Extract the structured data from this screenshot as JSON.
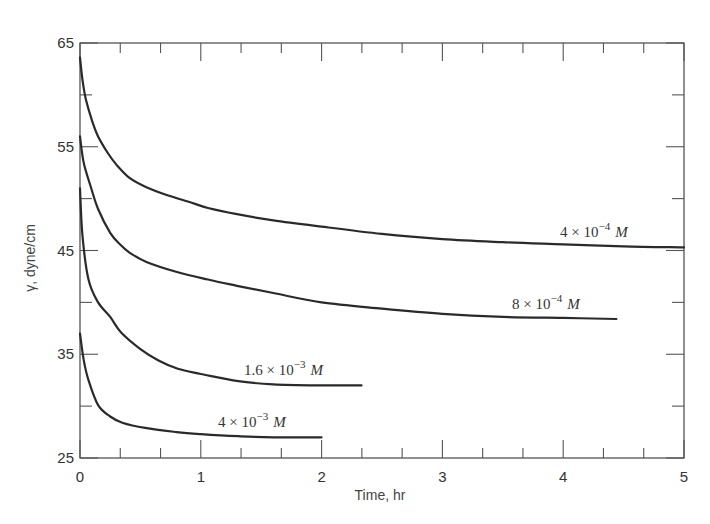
{
  "chart_data": {
    "type": "line",
    "title": "",
    "xlabel": "Time, hr",
    "ylabel": "γ, dyne/cm",
    "xlim": [
      0,
      5
    ],
    "ylim": [
      25,
      65
    ],
    "xticks": [
      0,
      1,
      2,
      3,
      4,
      5
    ],
    "x_minor_step": 0.3333,
    "yticks": [
      25,
      35,
      45,
      55,
      65
    ],
    "y_minor_step": 5,
    "grid": false,
    "legend": "inline curve labels",
    "series": [
      {
        "name": "4 × 10⁻⁴ M",
        "label_base": "4 × 10",
        "label_exp": "−4",
        "label_unit": "M",
        "label_pos": [
          560,
          237
        ],
        "x": [
          0,
          0.02,
          0.05,
          0.1,
          0.15,
          0.23,
          0.3,
          0.41,
          0.55,
          0.73,
          0.9,
          1.06,
          1.3,
          1.6,
          2.0,
          2.5,
          3.0,
          3.5,
          4.0,
          4.5,
          5.0
        ],
        "y": [
          63.6,
          61.5,
          59.5,
          57.5,
          56.0,
          54.4,
          53.3,
          52.0,
          51.1,
          50.3,
          49.7,
          49.1,
          48.5,
          47.9,
          47.3,
          46.6,
          46.1,
          45.8,
          45.6,
          45.4,
          45.3
        ]
      },
      {
        "name": "8 × 10⁻⁴ M",
        "label_base": "8 × 10",
        "label_exp": "−4",
        "label_unit": "M",
        "label_pos": [
          512,
          309
        ],
        "x": [
          0,
          0.03,
          0.09,
          0.15,
          0.25,
          0.33,
          0.41,
          0.55,
          0.81,
          1.06,
          1.3,
          1.6,
          2.0,
          2.5,
          3.0,
          3.5,
          4.0,
          4.44
        ],
        "y": [
          56.0,
          53.5,
          51.1,
          49.0,
          46.7,
          45.6,
          44.8,
          43.9,
          42.9,
          42.2,
          41.6,
          40.9,
          40.0,
          39.4,
          38.9,
          38.6,
          38.5,
          38.4
        ]
      },
      {
        "name": "1.6 × 10⁻³ M",
        "label_base": "1.6 × 10",
        "label_exp": "−3",
        "label_unit": "M",
        "label_pos": [
          244,
          375
        ],
        "x": [
          0,
          0.02,
          0.07,
          0.15,
          0.25,
          0.34,
          0.5,
          0.65,
          0.81,
          1.0,
          1.31,
          1.6,
          2.0,
          2.33
        ],
        "y": [
          51.0,
          46.5,
          42.2,
          40.0,
          38.6,
          37.1,
          35.5,
          34.4,
          33.6,
          33.1,
          32.4,
          32.1,
          32.0,
          32.0
        ]
      },
      {
        "name": "4 × 10⁻³ M",
        "label_base": "4 × 10",
        "label_exp": "−3",
        "label_unit": "M",
        "label_pos": [
          218,
          427
        ],
        "x": [
          0,
          0.03,
          0.07,
          0.15,
          0.25,
          0.35,
          0.54,
          0.8,
          1.0,
          1.31,
          1.6,
          2.0
        ],
        "y": [
          37.0,
          34.5,
          32.5,
          30.1,
          29.0,
          28.4,
          27.9,
          27.5,
          27.3,
          27.1,
          27.0,
          27.0
        ]
      }
    ]
  },
  "axes": {
    "x_title": "Time, hr",
    "y_title": "γ, dyne/cm",
    "x_tick_labels": [
      "0",
      "1",
      "2",
      "3",
      "4",
      "5"
    ],
    "y_tick_labels": [
      "25",
      "35",
      "45",
      "55",
      "65"
    ]
  },
  "colors": {
    "curve": "#2a2a2a",
    "axis": "#555555",
    "text": "#333333",
    "background": "#ffffff"
  }
}
